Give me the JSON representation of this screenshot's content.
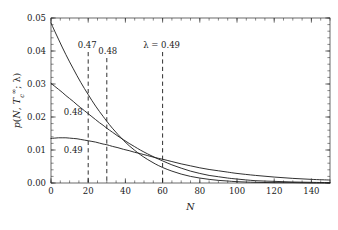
{
  "chart_data": {
    "type": "line",
    "title": "",
    "subtitle": "",
    "xlabel": "N",
    "ylabel": "p(N, Tₑ∞; λ)",
    "ylabel_parts": {
      "p": "p",
      "open": "(",
      "N": "N",
      "comma": ", ",
      "T": "T",
      "sub": "c",
      "sup": "∞",
      "semi": "; ",
      "lambda": "λ",
      "close": ")"
    },
    "xlim": [
      0,
      150
    ],
    "ylim": [
      0.0,
      0.05
    ],
    "grid": false,
    "legend": "inline-curve-labels",
    "xticks": [
      0,
      20,
      40,
      60,
      80,
      100,
      120,
      140
    ],
    "xticklabels": [
      "0",
      "20",
      "40",
      "60",
      "80",
      "100",
      "120",
      "140"
    ],
    "xminor_step": 5,
    "yticks": [
      0.0,
      0.01,
      0.02,
      0.03,
      0.04,
      0.05
    ],
    "yticklabels": [
      "0.00",
      "0.01",
      "0.02",
      "0.03",
      "0.04",
      "0.05"
    ],
    "yminor_step": 0.002,
    "series": [
      {
        "name": "0.47",
        "lambda": 0.47,
        "x": [
          0,
          2,
          4,
          6,
          8,
          10,
          12,
          14,
          16,
          18,
          20,
          22,
          24,
          26,
          28,
          30,
          33,
          36,
          39,
          42,
          45,
          48,
          52,
          56,
          60,
          65,
          70,
          75,
          80,
          85,
          90,
          95,
          100,
          110,
          120,
          130,
          140,
          150
        ],
        "values": [
          0.0485,
          0.046,
          0.0436,
          0.0412,
          0.0389,
          0.0367,
          0.0346,
          0.0325,
          0.0305,
          0.0286,
          0.0268,
          0.025,
          0.0233,
          0.0217,
          0.0202,
          0.0187,
          0.0166,
          0.0147,
          0.0129,
          0.0113,
          0.0099,
          0.0086,
          0.0071,
          0.0058,
          0.0047,
          0.0036,
          0.0027,
          0.002,
          0.0015,
          0.0011,
          0.0008,
          0.0006,
          0.0004,
          0.0002,
          0.0001,
          0.0001,
          0.0,
          0.0
        ]
      },
      {
        "name": "0.48",
        "lambda": 0.48,
        "x": [
          0,
          2,
          4,
          6,
          8,
          10,
          12,
          14,
          16,
          18,
          20,
          22,
          24,
          26,
          28,
          30,
          33,
          36,
          39,
          42,
          45,
          48,
          52,
          56,
          60,
          65,
          70,
          75,
          80,
          85,
          90,
          95,
          100,
          110,
          120,
          130,
          140,
          150
        ],
        "values": [
          0.0302,
          0.0293,
          0.0284,
          0.0275,
          0.0265,
          0.0256,
          0.0247,
          0.0237,
          0.0228,
          0.0219,
          0.021,
          0.0201,
          0.0192,
          0.0183,
          0.0175,
          0.0166,
          0.0154,
          0.0142,
          0.0131,
          0.012,
          0.011,
          0.01,
          0.0088,
          0.0077,
          0.0067,
          0.0055,
          0.0045,
          0.0036,
          0.0029,
          0.0023,
          0.0019,
          0.0015,
          0.0012,
          0.0007,
          0.0005,
          0.0003,
          0.0002,
          0.0001
        ]
      },
      {
        "name": "0.49",
        "lambda": 0.49,
        "x": [
          0,
          2,
          4,
          6,
          8,
          10,
          12,
          14,
          16,
          18,
          20,
          22,
          24,
          26,
          28,
          30,
          33,
          36,
          39,
          42,
          45,
          48,
          52,
          56,
          60,
          65,
          70,
          75,
          80,
          85,
          90,
          95,
          100,
          110,
          120,
          130,
          140,
          150
        ],
        "values": [
          0.0135,
          0.0136,
          0.0137,
          0.0137,
          0.0137,
          0.0136,
          0.0135,
          0.0134,
          0.0132,
          0.013,
          0.0128,
          0.0126,
          0.0124,
          0.0121,
          0.0118,
          0.0116,
          0.0111,
          0.0107,
          0.0102,
          0.0098,
          0.0093,
          0.0089,
          0.0083,
          0.0077,
          0.0072,
          0.0065,
          0.0058,
          0.0052,
          0.0046,
          0.0041,
          0.0037,
          0.0033,
          0.0029,
          0.0023,
          0.0018,
          0.0014,
          0.0011,
          0.0009
        ]
      }
    ],
    "curve_labels": [
      {
        "text": "0.48",
        "x_data": 12,
        "y_data": 0.0205
      },
      {
        "text": "0.49",
        "x_data": 12,
        "y_data": 0.0092
      }
    ],
    "vlines": [
      {
        "x_data": 20,
        "label": "0.47",
        "style": "dashed"
      },
      {
        "x_data": 30,
        "label": "0.48",
        "style": "dashed"
      },
      {
        "x_data": 60,
        "label": "λ = 0.49",
        "style": "dashed"
      }
    ],
    "colors": {
      "curve": "#1a1a1a",
      "axis": "#2a2a2a",
      "dashed": "#1a1a1a",
      "background": "#ffffff"
    }
  }
}
